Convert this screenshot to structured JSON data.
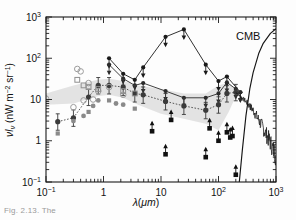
{
  "figure": {
    "caption_partial": "Fig. 2.13. The",
    "cmb_label": "CMB",
    "ylabel": "νIν (nW m−2 sr−1)",
    "xlabel": "λ(μm)"
  },
  "chart_data": {
    "type": "scatter",
    "title": "",
    "xlabel": "λ(μm)",
    "ylabel": "νIν (nW m−2 sr−1)",
    "xscale": "log",
    "yscale": "log",
    "xlim": [
      0.1,
      1000
    ],
    "ylim": [
      0.1,
      1000
    ],
    "xticks": [
      "10−1",
      "1",
      "10",
      "10²",
      "10³"
    ],
    "xtick_values": [
      0.1,
      1,
      10,
      100,
      1000
    ],
    "yticks": [
      "10−1",
      "1",
      "10",
      "10²",
      "10³"
    ],
    "ytick_values": [
      0.1,
      1,
      10,
      100,
      1000
    ],
    "grid": false,
    "legend": "none",
    "annotations": [
      {
        "text": "CMB",
        "x": 330,
        "y": 170
      }
    ],
    "series": [
      {
        "name": "upper-limit-envelope-high",
        "style": "line-with-downarrow-markers",
        "color": "#1a1a1a",
        "x": [
          1.25,
          2.2,
          3.5,
          4.9,
          12,
          25,
          60,
          100,
          140,
          240
        ],
        "values": [
          100,
          42,
          30,
          60,
          330,
          500,
          70,
          28,
          36,
          15
        ]
      },
      {
        "name": "upper-limits-mid",
        "style": "line-with-downarrow-markers",
        "color": "#2b2b2b",
        "x": [
          1.25,
          2.2,
          3.5,
          4.9,
          12,
          25,
          60,
          100,
          140,
          200,
          240
        ],
        "values": [
          70,
          32,
          22,
          25,
          16,
          11,
          11,
          14,
          26,
          18,
          15
        ]
      },
      {
        "name": "detections-dotted",
        "style": "dotted-line-filled-circles",
        "color": "#3a3a3a",
        "x": [
          0.16,
          0.3,
          0.55,
          0.81,
          1.25,
          2.2,
          3.5,
          4.9,
          12,
          25,
          60,
          100,
          140,
          200
        ],
        "values": [
          2.9,
          3.6,
          11.5,
          22,
          22,
          20,
          14,
          13,
          9,
          7,
          5.5,
          7.5,
          14,
          15
        ]
      },
      {
        "name": "galaxy-counts-gray",
        "style": "gray-filled-markers",
        "color": "#8a8a8a",
        "x": [
          0.16,
          0.3,
          0.45,
          0.55,
          0.66,
          0.81,
          1.25,
          1.65,
          2.2,
          3.5
        ],
        "values": [
          1.5,
          3.0,
          4.0,
          5.0,
          7.0,
          9.5,
          9.5,
          8.0,
          7.5,
          6.0
        ]
      },
      {
        "name": "open-circles-measurements",
        "style": "open-circles",
        "color": "#9c9c9c",
        "x": [
          0.1,
          0.3,
          0.35,
          0.4,
          0.45,
          0.55,
          0.66,
          0.81,
          1.25,
          2.2
        ],
        "values": [
          10.5,
          6.5,
          55,
          48,
          9.5,
          25,
          10,
          16,
          20,
          13
        ]
      },
      {
        "name": "open-squares",
        "style": "open-squares",
        "color": "#8f8f8f",
        "x": [
          0.35,
          0.45,
          0.55,
          0.81,
          2.2,
          3.5
        ],
        "values": [
          30,
          22,
          20,
          18,
          16,
          14
        ]
      },
      {
        "name": "lower-limits-squares",
        "style": "filled-squares-uparrow",
        "color": "#101010",
        "x": [
          7,
          12,
          15,
          60,
          70,
          100,
          140,
          160,
          175,
          200
        ],
        "values": [
          1.7,
          0.47,
          3.2,
          0.4,
          2.0,
          1.0,
          1.6,
          1.2,
          1.3,
          0.15
        ]
      },
      {
        "name": "firas-spectrum",
        "style": "noisy-line",
        "color": "#1a1a1a",
        "x": [
          200,
          300,
          400,
          500,
          600,
          700,
          800,
          900,
          1000
        ],
        "values": [
          15,
          9,
          5.5,
          3.2,
          2.0,
          1.3,
          0.9,
          0.6,
          0.42
        ]
      },
      {
        "name": "cmb-blackbody",
        "style": "solid-line",
        "color": "#151515",
        "x": [
          230,
          260,
          300,
          350,
          400,
          500,
          600,
          800,
          1000
        ],
        "values": [
          0.1,
          0.6,
          4,
          18,
          45,
          130,
          230,
          400,
          520
        ]
      },
      {
        "name": "shaded-band-upper",
        "style": "band",
        "color": "#d9d9d9",
        "x": [
          0.1,
          0.3,
          0.8,
          1.25,
          2.2,
          4,
          10,
          25,
          60,
          100,
          150,
          200
        ],
        "values": [
          14,
          22,
          30,
          32,
          28,
          22,
          18,
          14,
          14,
          22,
          26,
          17
        ]
      },
      {
        "name": "shaded-band-lower",
        "style": "band",
        "color": "#d9d9d9",
        "x": [
          0.1,
          0.3,
          0.8,
          1.25,
          2.2,
          4,
          10,
          25,
          60,
          100,
          150,
          200
        ],
        "values": [
          7.5,
          8.0,
          12,
          13,
          11,
          7.5,
          4.5,
          3.4,
          2.6,
          1.8,
          5.0,
          12
        ]
      }
    ]
  }
}
